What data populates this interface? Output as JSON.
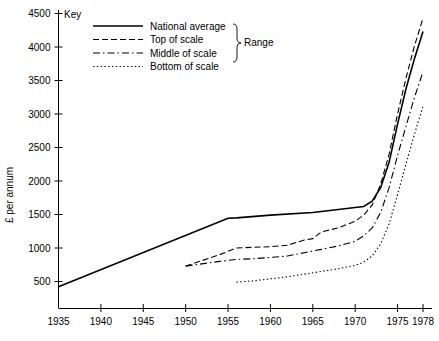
{
  "chart_data": {
    "type": "line",
    "title": "",
    "xlabel": "",
    "ylabel": "£ per annum",
    "xlim": [
      1935,
      1978
    ],
    "ylim": [
      100,
      4600
    ],
    "grid": false,
    "legend_position": "top-left",
    "legend_title": "Key",
    "legend_group_label": "Range",
    "x_ticks": [
      1935,
      1940,
      1945,
      1950,
      1955,
      1960,
      1965,
      1970,
      1975,
      1978
    ],
    "x_tick_labels": [
      "1935",
      "1940",
      "1945",
      "1950",
      "1955",
      "1960",
      "1965",
      "1970",
      "1975",
      "1978"
    ],
    "y_ticks": [
      500,
      1000,
      1500,
      2000,
      2500,
      3000,
      3500,
      4000,
      4500
    ],
    "y_tick_labels": [
      "500",
      "1000",
      "1500",
      "2000",
      "2500",
      "3000",
      "3500",
      "4000",
      "4500"
    ],
    "series": [
      {
        "name": "National average",
        "style": "solid",
        "dash": "none",
        "color": "#000000",
        "width": 1.6,
        "points": [
          [
            1935,
            420
          ],
          [
            1955,
            1445
          ],
          [
            1956,
            1450
          ],
          [
            1960,
            1490
          ],
          [
            1965,
            1530
          ],
          [
            1971,
            1620
          ],
          [
            1972,
            1700
          ],
          [
            1973,
            1900
          ],
          [
            1974,
            2280
          ],
          [
            1975,
            2850
          ],
          [
            1976,
            3380
          ],
          [
            1977,
            3830
          ],
          [
            1978,
            4230
          ]
        ]
      },
      {
        "name": "Top of scale",
        "style": "dashed",
        "dash": "6,3",
        "color": "#000000",
        "width": 1.1,
        "points": [
          [
            1950,
            730
          ],
          [
            1954,
            900
          ],
          [
            1956,
            1000
          ],
          [
            1958,
            1010
          ],
          [
            1960,
            1020
          ],
          [
            1962,
            1040
          ],
          [
            1964,
            1120
          ],
          [
            1965,
            1140
          ],
          [
            1966,
            1240
          ],
          [
            1968,
            1300
          ],
          [
            1970,
            1400
          ],
          [
            1971,
            1490
          ],
          [
            1972,
            1640
          ],
          [
            1973,
            1950
          ],
          [
            1974,
            2400
          ],
          [
            1975,
            3000
          ],
          [
            1976,
            3540
          ],
          [
            1977,
            4020
          ],
          [
            1978,
            4430
          ]
        ]
      },
      {
        "name": "Middle of scale",
        "style": "dash-dot",
        "dash": "7,3,1.5,3",
        "color": "#000000",
        "width": 1.1,
        "points": [
          [
            1950,
            730
          ],
          [
            1954,
            800
          ],
          [
            1956,
            830
          ],
          [
            1958,
            840
          ],
          [
            1960,
            860
          ],
          [
            1962,
            880
          ],
          [
            1964,
            930
          ],
          [
            1966,
            980
          ],
          [
            1968,
            1030
          ],
          [
            1970,
            1100
          ],
          [
            1971,
            1180
          ],
          [
            1972,
            1300
          ],
          [
            1973,
            1530
          ],
          [
            1974,
            1900
          ],
          [
            1975,
            2380
          ],
          [
            1976,
            2820
          ],
          [
            1977,
            3250
          ],
          [
            1978,
            3630
          ]
        ]
      },
      {
        "name": "Bottom of scale",
        "style": "dotted",
        "dash": "1.4,2.4",
        "color": "#000000",
        "width": 1.1,
        "points": [
          [
            1956,
            490
          ],
          [
            1958,
            510
          ],
          [
            1960,
            540
          ],
          [
            1962,
            570
          ],
          [
            1964,
            610
          ],
          [
            1966,
            650
          ],
          [
            1968,
            690
          ],
          [
            1970,
            740
          ],
          [
            1971,
            790
          ],
          [
            1972,
            880
          ],
          [
            1973,
            1060
          ],
          [
            1974,
            1360
          ],
          [
            1975,
            1800
          ],
          [
            1976,
            2260
          ],
          [
            1977,
            2700
          ],
          [
            1978,
            3120
          ]
        ]
      }
    ]
  },
  "legend": {
    "title": "Key",
    "group_label": "Range",
    "entries": [
      {
        "label": "National average",
        "style": "solid"
      },
      {
        "label": "Top of scale",
        "style": "dashed"
      },
      {
        "label": "Middle of scale",
        "style": "dash-dot"
      },
      {
        "label": "Bottom of scale",
        "style": "dotted"
      }
    ]
  },
  "axes": {
    "y_title": "£ per annum"
  }
}
